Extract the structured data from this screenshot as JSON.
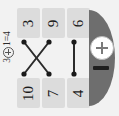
{
  "canvas": {
    "width": 119,
    "height": 116,
    "background": "#f2f2f2"
  },
  "equation": {
    "left_operand": "3",
    "operator": "oplus",
    "right_operand": "1",
    "equals": "=",
    "result": "4",
    "full_text": "3 ⊕ 1 = 4",
    "orientation": "rotated-90-ccw"
  },
  "grid": {
    "rows": 2,
    "columns": 3,
    "cell_color": "#dcdcdc",
    "text_color": "#1a1a1a",
    "top_row": [
      {
        "label": "3",
        "name": "cell-top-0"
      },
      {
        "label": "9",
        "name": "cell-top-1"
      },
      {
        "label": "6",
        "name": "cell-top-2"
      }
    ],
    "bottom_row": [
      {
        "label": "10",
        "name": "cell-bottom-0"
      },
      {
        "label": "7",
        "name": "cell-bottom-1"
      },
      {
        "label": "4",
        "name": "cell-bottom-2"
      }
    ]
  },
  "links": {
    "stroke_color": "#2b2b2b",
    "node_color": "#1a1a1a",
    "nodes_top": [
      {
        "id": "t0",
        "x": 7,
        "y": 34
      },
      {
        "id": "t1",
        "x": 32,
        "y": 34
      },
      {
        "id": "t2",
        "x": 57,
        "y": 34
      }
    ],
    "nodes_bottom": [
      {
        "id": "b0",
        "x": 7,
        "y": 66
      },
      {
        "id": "b1",
        "x": 32,
        "y": 66
      },
      {
        "id": "b2",
        "x": 57,
        "y": 66
      }
    ],
    "edges": [
      {
        "from": "t0",
        "to": "b1",
        "from_label": "3",
        "to_label": "7"
      },
      {
        "from": "t1",
        "to": "b0",
        "from_label": "9",
        "to_label": "10"
      },
      {
        "from": "t2",
        "to": "b2",
        "from_label": "6",
        "to_label": "4"
      }
    ]
  },
  "control_panel": {
    "shape": "semicircle",
    "fill": "#6e6e6e",
    "plus_button": {
      "icon": "plus-icon",
      "label": "+",
      "fill": "#ffffff",
      "stroke": "#b9b9b9"
    },
    "minus_indicator": {
      "icon": "minus-icon",
      "label": "−",
      "fill": "#1e1e1e"
    }
  }
}
